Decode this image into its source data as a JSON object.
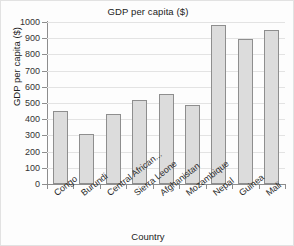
{
  "chart_data": {
    "type": "bar",
    "title": "GDP per capita ($)",
    "xlabel": "Country",
    "ylabel": "GDP per capita ($)",
    "categories": [
      "Congo",
      "Burundi",
      "Central African...",
      "Sierra Leone",
      "Afghanistan",
      "Mozambique",
      "Nepal",
      "Guinea",
      "Mali"
    ],
    "values": [
      450,
      310,
      435,
      520,
      555,
      487,
      980,
      895,
      950
    ],
    "ylim": [
      0,
      1000
    ],
    "yticks": [
      0,
      100,
      200,
      300,
      400,
      500,
      600,
      700,
      800,
      900,
      1000
    ],
    "ytick_labels": [
      "0",
      "100",
      "200",
      "300",
      "400",
      "500",
      "600",
      "700",
      "800",
      "900",
      "1000"
    ],
    "grid": true,
    "legend": false,
    "bar_fill_color": "#dcdcdc",
    "bar_edge_color": "#8e8e8e",
    "axis_color": "#8d8d8d",
    "grid_color": "#e3e3e3",
    "background_color": "#fdfdfd"
  }
}
